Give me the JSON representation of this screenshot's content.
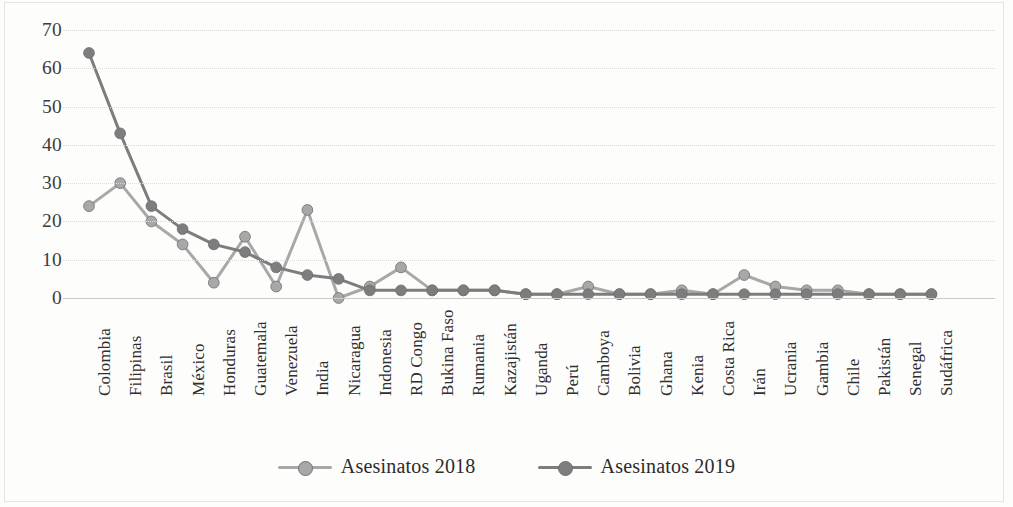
{
  "chart_data": {
    "type": "line",
    "title": "",
    "xlabel": "",
    "ylabel": "",
    "ylim": [
      0,
      70
    ],
    "yticks": [
      0,
      10,
      20,
      30,
      40,
      50,
      60,
      70
    ],
    "grid": true,
    "legend_position": "bottom",
    "categories": [
      "Colombia",
      "Filipinas",
      "Brasil",
      "México",
      "Honduras",
      "Guatemala",
      "Venezuela",
      "India",
      "Nicaragua",
      "Indonesia",
      "RD Congo",
      "Bukina Faso",
      "Rumania",
      "Kazajistán",
      "Uganda",
      "Perú",
      "Camboya",
      "Bolivia",
      "Ghana",
      "Kenia",
      "Costa Rica",
      "Irán",
      "Ucrania",
      "Gambia",
      "Chile",
      "Pakistán",
      "Senegal",
      "Sudáfrica"
    ],
    "series": [
      {
        "name": "Asesinatos 2018",
        "color": "#a8a8a8",
        "values": [
          24,
          30,
          20,
          14,
          4,
          16,
          3,
          23,
          0,
          3,
          8,
          2,
          2,
          2,
          1,
          1,
          3,
          1,
          1,
          2,
          1,
          6,
          3,
          2,
          2,
          1,
          1,
          1
        ]
      },
      {
        "name": "Asesinatos 2019",
        "color": "#7d7d7d",
        "values": [
          64,
          43,
          24,
          18,
          14,
          12,
          8,
          6,
          5,
          2,
          2,
          2,
          2,
          2,
          1,
          1,
          1,
          1,
          1,
          1,
          1,
          1,
          1,
          1,
          1,
          1,
          1,
          1
        ]
      }
    ]
  },
  "legend": {
    "items": [
      {
        "label": "Asesinatos 2018"
      },
      {
        "label": "Asesinatos 2019"
      }
    ]
  }
}
